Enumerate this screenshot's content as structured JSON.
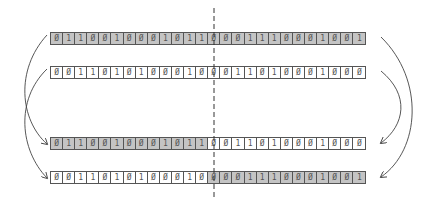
{
  "diagram": {
    "type": "single-point crossover",
    "cut_after_index": 13,
    "colors": {
      "parent_a": "#c4c4c4",
      "parent_b": "#ffffff",
      "border": "#555555"
    },
    "rows": [
      {
        "name": "parent-a",
        "top": 32,
        "bits": [
          "0",
          "1",
          "1",
          "0",
          "0",
          "1",
          "0",
          "0",
          "0",
          "1",
          "0",
          "1",
          "1",
          "0",
          "0",
          "0",
          "1",
          "1",
          "1",
          "0",
          "0",
          "0",
          "1",
          "0",
          "0",
          "1"
        ],
        "shade": [
          "g",
          "g",
          "g",
          "g",
          "g",
          "g",
          "g",
          "g",
          "g",
          "g",
          "g",
          "g",
          "g",
          "g",
          "g",
          "g",
          "g",
          "g",
          "g",
          "g",
          "g",
          "g",
          "g",
          "g",
          "g",
          "g"
        ]
      },
      {
        "name": "parent-b",
        "top": 66,
        "bits": [
          "0",
          "0",
          "1",
          "1",
          "0",
          "1",
          "0",
          "1",
          "0",
          "0",
          "0",
          "1",
          "0",
          "0",
          "0",
          "1",
          "1",
          "0",
          "1",
          "0",
          "0",
          "0",
          "1",
          "0",
          "0",
          "0"
        ],
        "shade": [
          "w",
          "w",
          "w",
          "w",
          "w",
          "w",
          "w",
          "w",
          "w",
          "w",
          "w",
          "w",
          "w",
          "w",
          "w",
          "w",
          "w",
          "w",
          "w",
          "w",
          "w",
          "w",
          "w",
          "w",
          "w",
          "w"
        ]
      },
      {
        "name": "child-1",
        "top": 137,
        "bits": [
          "0",
          "1",
          "1",
          "0",
          "0",
          "1",
          "0",
          "0",
          "0",
          "1",
          "0",
          "1",
          "1",
          "0",
          "0",
          "1",
          "1",
          "0",
          "1",
          "0",
          "0",
          "0",
          "1",
          "0",
          "0",
          "0"
        ],
        "shade": [
          "g",
          "g",
          "g",
          "g",
          "g",
          "g",
          "g",
          "g",
          "g",
          "g",
          "g",
          "g",
          "g",
          "w",
          "w",
          "w",
          "w",
          "w",
          "w",
          "w",
          "w",
          "w",
          "w",
          "w",
          "w",
          "w"
        ]
      },
      {
        "name": "child-2",
        "top": 171,
        "bits": [
          "0",
          "0",
          "1",
          "1",
          "0",
          "1",
          "0",
          "1",
          "0",
          "0",
          "0",
          "1",
          "0",
          "0",
          "0",
          "0",
          "1",
          "1",
          "1",
          "0",
          "0",
          "0",
          "1",
          "0",
          "0",
          "1"
        ],
        "shade": [
          "w",
          "w",
          "w",
          "w",
          "w",
          "w",
          "w",
          "w",
          "w",
          "w",
          "w",
          "w",
          "w",
          "g",
          "g",
          "g",
          "g",
          "g",
          "g",
          "g",
          "g",
          "g",
          "g",
          "g",
          "g",
          "g"
        ]
      }
    ]
  }
}
